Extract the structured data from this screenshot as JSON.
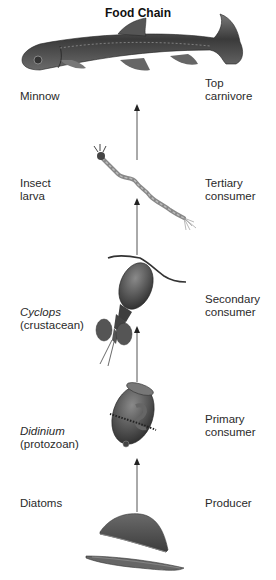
{
  "title": "Food Chain",
  "levels": [
    {
      "organism": "Minnow",
      "organism_note": "",
      "role_line1": "Top",
      "role_line2": "carnivore"
    },
    {
      "organism": "Insect",
      "organism_note": "larva",
      "role_line1": "Tertiary",
      "role_line2": "consumer"
    },
    {
      "organism": "Cyclops",
      "organism_note": "(crustacean)",
      "role_line1": "Secondary",
      "role_line2": "consumer"
    },
    {
      "organism": "Didinium",
      "organism_note": "(protozoan)",
      "role_line1": "Primary",
      "role_line2": "consumer"
    },
    {
      "organism": "Diatoms",
      "organism_note": "",
      "role_line1": "Producer",
      "role_line2": ""
    }
  ],
  "colors": {
    "arrow": "#555555",
    "organism_fill": "#4a4a4a",
    "text": "#2a2a2a"
  }
}
